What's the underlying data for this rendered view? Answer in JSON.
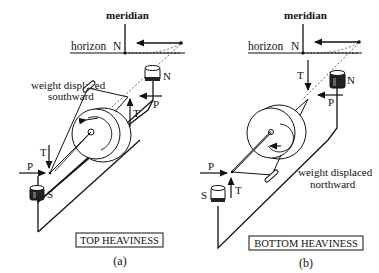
{
  "figure": {
    "panel_a": {
      "meridian_label": "meridian",
      "horizon_label": "horizon",
      "north_label": "N",
      "weight_label_line1": "weight displaced",
      "weight_label_line2": "southward",
      "north_cup_label": "N",
      "south_cup_label": "S",
      "force_p_upper": "P",
      "force_t_upper": "T",
      "force_t_lower": "T",
      "force_p_lower": "P",
      "caption_box": "TOP HEAVINESS",
      "panel_letter": "(a)"
    },
    "panel_b": {
      "meridian_label": "meridian",
      "horizon_label": "horizon",
      "north_label": "N",
      "weight_label_line1": "weight displaced",
      "weight_label_line2": "northward",
      "north_cup_label": "N",
      "south_cup_label": "S",
      "force_t_upper": "T",
      "force_p_upper": "P",
      "force_p_lower": "P",
      "force_t_lower": "T",
      "caption_box": "BOTTOM HEAVINESS",
      "panel_letter": "(b)"
    }
  }
}
